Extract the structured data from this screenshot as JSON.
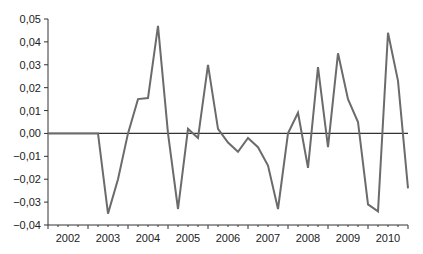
{
  "chart_data": {
    "type": "line",
    "title": "",
    "xlabel": "",
    "ylabel": "",
    "ylim": [
      -0.04,
      0.05
    ],
    "grid": false,
    "legend": null,
    "y_ticks": [
      "0,05",
      "0,04",
      "0,03",
      "0,02",
      "0,01",
      "0,00",
      "-0,01",
      "-0,02",
      "-0,03",
      "-0,04"
    ],
    "y_tick_values": [
      0.05,
      0.04,
      0.03,
      0.02,
      0.01,
      0.0,
      -0.01,
      -0.02,
      -0.03,
      -0.04
    ],
    "x_tick_labels": [
      "2002",
      "2003",
      "2004",
      "2005",
      "2006",
      "2007",
      "2008",
      "2009",
      "2010"
    ],
    "x_range": [
      "2002Q1",
      "2010Q4"
    ],
    "reference_line": 0.0,
    "series": [
      {
        "name": "series",
        "color": "#6b6b6b",
        "x": [
          "2002Q1",
          "2002Q2",
          "2002Q3",
          "2002Q4",
          "2003Q1",
          "2003Q2",
          "2003Q3",
          "2003Q4",
          "2004Q1",
          "2004Q2",
          "2004Q3",
          "2004Q4",
          "2005Q1",
          "2005Q2",
          "2005Q3",
          "2005Q4",
          "2006Q1",
          "2006Q2",
          "2006Q3",
          "2006Q4",
          "2007Q1",
          "2007Q2",
          "2007Q3",
          "2007Q4",
          "2008Q1",
          "2008Q2",
          "2008Q3",
          "2008Q4",
          "2009Q1",
          "2009Q2",
          "2009Q3",
          "2009Q4",
          "2010Q1",
          "2010Q2",
          "2010Q3",
          "2010Q4"
        ],
        "values": [
          0.0,
          0.0,
          0.0,
          0.0,
          0.0,
          -0.035,
          -0.02,
          0.0,
          0.015,
          0.0155,
          0.047,
          0.0,
          -0.033,
          0.002,
          -0.002,
          0.03,
          0.002,
          -0.004,
          -0.008,
          -0.002,
          -0.006,
          -0.014,
          -0.033,
          0.0,
          0.009,
          -0.015,
          0.029,
          -0.006,
          0.035,
          0.015,
          0.005,
          -0.031,
          -0.034,
          0.044,
          0.023,
          -0.024
        ]
      }
    ],
    "final_point": -0.002
  }
}
